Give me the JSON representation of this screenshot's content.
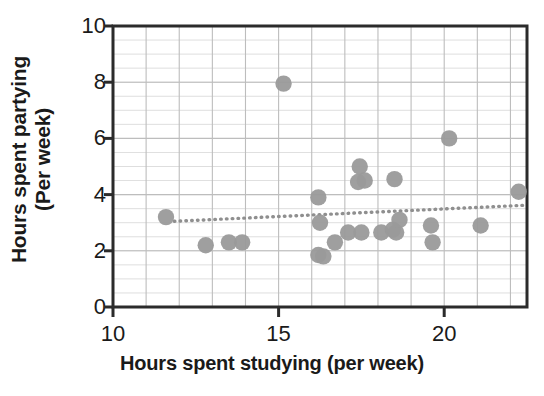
{
  "chart_data": {
    "type": "scatter",
    "title": "",
    "xlabel": "Hours spent studying (per week)",
    "ylabel_line1": "Hours spent partying",
    "ylabel_line2": "(Per week)",
    "xlim": [
      10,
      22.5
    ],
    "ylim": [
      0,
      10
    ],
    "xticks": [
      10,
      15,
      20
    ],
    "xtick_labels": [
      "10",
      "15",
      "20"
    ],
    "yticks": [
      0,
      2,
      4,
      6,
      8,
      10
    ],
    "ytick_labels": [
      "0",
      "2",
      "4",
      "6",
      "8",
      "10"
    ],
    "x_minor_step": 0.5,
    "y_minor_step": 0.5,
    "grid": true,
    "legend": "none",
    "marker_color": "#9a9a9a",
    "axis_color": "#2b2b2b",
    "grid_color": "#c9c9c9",
    "trendline": {
      "style": "dotted",
      "color": "#8f8f8f",
      "x_start": 11.85,
      "y_start": 3.05,
      "x_end": 22.4,
      "y_end": 3.62
    },
    "points": [
      {
        "x": 11.6,
        "y": 3.2
      },
      {
        "x": 12.8,
        "y": 2.2
      },
      {
        "x": 13.5,
        "y": 2.3
      },
      {
        "x": 13.9,
        "y": 2.3
      },
      {
        "x": 15.15,
        "y": 7.95
      },
      {
        "x": 16.2,
        "y": 3.9
      },
      {
        "x": 16.25,
        "y": 3.0
      },
      {
        "x": 16.2,
        "y": 1.85
      },
      {
        "x": 16.35,
        "y": 1.8
      },
      {
        "x": 16.7,
        "y": 2.3
      },
      {
        "x": 17.1,
        "y": 2.65
      },
      {
        "x": 17.45,
        "y": 5.0
      },
      {
        "x": 17.4,
        "y": 4.45
      },
      {
        "x": 17.6,
        "y": 4.5
      },
      {
        "x": 17.5,
        "y": 2.65
      },
      {
        "x": 18.1,
        "y": 2.65
      },
      {
        "x": 18.5,
        "y": 4.55
      },
      {
        "x": 18.45,
        "y": 2.75
      },
      {
        "x": 18.55,
        "y": 2.65
      },
      {
        "x": 18.65,
        "y": 3.1
      },
      {
        "x": 19.6,
        "y": 2.9
      },
      {
        "x": 19.65,
        "y": 2.3
      },
      {
        "x": 20.15,
        "y": 6.0
      },
      {
        "x": 21.1,
        "y": 2.9
      },
      {
        "x": 22.25,
        "y": 4.1
      }
    ]
  }
}
